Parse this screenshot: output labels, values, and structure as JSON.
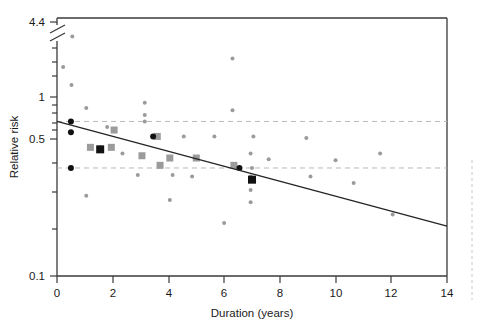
{
  "figure": {
    "title": "",
    "background": "#ffffff",
    "width": 482,
    "height": 332
  },
  "axes": {
    "x_title": "Duration (years)",
    "y_title": "Relative risk",
    "x_ticks": [
      "0",
      "2",
      "4",
      "6",
      "8",
      "10",
      "12",
      "14"
    ],
    "y_ticks_major": [
      "0.1",
      "0.5",
      "1",
      "4.4"
    ],
    "y_axis_break": true,
    "y_scale": "log"
  },
  "chart_data": {
    "type": "scatter",
    "title": "",
    "xlabel": "Duration (years)",
    "ylabel": "Relative risk",
    "xlim": [
      0,
      14
    ],
    "ylim": [
      0.1,
      4.4
    ],
    "yscale": "log",
    "y_axis_break_near": 4.4,
    "grid": false,
    "gridlines_horizontal": [
      {
        "value": 1.0,
        "style": "dashed",
        "color": "#b9b9b9"
      },
      {
        "value": 0.5,
        "style": "dashed",
        "color": "#b9b9b9"
      }
    ],
    "legend": "none",
    "xticks": [
      0,
      2,
      4,
      6,
      8,
      10,
      12,
      14
    ],
    "yticks_major": [
      0.1,
      0.5,
      1.0,
      4.4
    ],
    "yticks_minor": [
      0.2,
      0.3,
      0.4,
      0.6,
      0.7,
      0.8,
      0.9,
      2.0,
      3.0
    ],
    "trend_line": {
      "label": "fitted regression line",
      "color": "#242424",
      "x_start": 0.0,
      "y_start": 1.0,
      "x_end": 14.0,
      "y_end": 0.21
    },
    "series": [
      {
        "name": "small study estimates",
        "marker": "small-gray-dot",
        "color": "#9b9b9b",
        "size": 4,
        "points": [
          {
            "x": 0.55,
            "y": 3.55
          },
          {
            "x": 0.22,
            "y": 2.25
          },
          {
            "x": 0.52,
            "y": 1.72
          },
          {
            "x": 1.05,
            "y": 1.22
          },
          {
            "x": 3.15,
            "y": 1.32
          },
          {
            "x": 3.15,
            "y": 1.1
          },
          {
            "x": 3.15,
            "y": 1.0
          },
          {
            "x": 6.3,
            "y": 2.55
          },
          {
            "x": 6.3,
            "y": 1.18
          },
          {
            "x": 4.55,
            "y": 0.8
          },
          {
            "x": 5.65,
            "y": 0.8
          },
          {
            "x": 7.05,
            "y": 0.8
          },
          {
            "x": 8.95,
            "y": 0.78
          },
          {
            "x": 1.55,
            "y": 0.68
          },
          {
            "x": 1.8,
            "y": 0.92
          },
          {
            "x": 2.35,
            "y": 0.62
          },
          {
            "x": 6.95,
            "y": 0.62
          },
          {
            "x": 7.6,
            "y": 0.57
          },
          {
            "x": 10.0,
            "y": 0.56
          },
          {
            "x": 11.6,
            "y": 0.62
          },
          {
            "x": 7.0,
            "y": 0.5
          },
          {
            "x": 2.9,
            "y": 0.45
          },
          {
            "x": 4.15,
            "y": 0.45
          },
          {
            "x": 4.85,
            "y": 0.44
          },
          {
            "x": 6.95,
            "y": 0.44
          },
          {
            "x": 9.1,
            "y": 0.44
          },
          {
            "x": 10.65,
            "y": 0.4
          },
          {
            "x": 1.05,
            "y": 0.33
          },
          {
            "x": 4.05,
            "y": 0.31
          },
          {
            "x": 6.95,
            "y": 0.36
          },
          {
            "x": 6.95,
            "y": 0.3
          },
          {
            "x": 12.05,
            "y": 0.25
          },
          {
            "x": 6.0,
            "y": 0.22
          }
        ]
      },
      {
        "name": "medium study estimates",
        "marker": "gray-square",
        "color": "#9b9b9b",
        "size": 7,
        "points": [
          {
            "x": 2.05,
            "y": 0.88
          },
          {
            "x": 3.6,
            "y": 0.8
          },
          {
            "x": 1.2,
            "y": 0.68
          },
          {
            "x": 1.95,
            "y": 0.68
          },
          {
            "x": 3.05,
            "y": 0.6
          },
          {
            "x": 5.0,
            "y": 0.58
          },
          {
            "x": 4.05,
            "y": 0.58
          },
          {
            "x": 6.35,
            "y": 0.52
          },
          {
            "x": 3.7,
            "y": 0.52
          }
        ]
      },
      {
        "name": "pooled / large study estimates (black circles)",
        "marker": "black-circle",
        "color": "#111111",
        "size": 6,
        "points": [
          {
            "x": 0.5,
            "y": 1.0
          },
          {
            "x": 0.5,
            "y": 0.85
          },
          {
            "x": 0.5,
            "y": 0.5
          },
          {
            "x": 3.45,
            "y": 0.8
          },
          {
            "x": 6.55,
            "y": 0.5
          }
        ]
      },
      {
        "name": "pooled / large study estimates (black squares)",
        "marker": "black-square",
        "color": "#111111",
        "size": 8,
        "points": [
          {
            "x": 1.55,
            "y": 0.66
          },
          {
            "x": 7.0,
            "y": 0.42
          }
        ]
      }
    ]
  }
}
